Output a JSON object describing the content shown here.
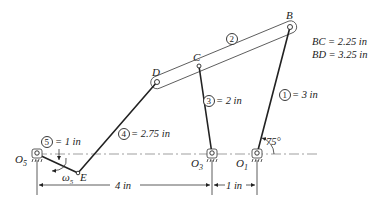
{
  "diagram": {
    "type": "six-bar linkage kinematic diagram",
    "joints": {
      "B": "B",
      "C": "C",
      "D": "D",
      "E": "E",
      "O1": "O",
      "O1_sub": "1",
      "O3": "O",
      "O3_sub": "3",
      "O5": "O",
      "O5_sub": "5"
    },
    "links": [
      {
        "id": "1",
        "label": "= 3 in"
      },
      {
        "id": "2",
        "label": ""
      },
      {
        "id": "3",
        "label": "= 2 in"
      },
      {
        "id": "4",
        "label": "= 2.75 in"
      },
      {
        "id": "5",
        "label": "= 1 in"
      }
    ],
    "notes": {
      "bc": "BC = 2.25 in",
      "bd": "BD = 3.25 in"
    },
    "angle": "75°",
    "omega": "ω",
    "omega_sub": "5",
    "dimensions": {
      "o5_o3": "4 in",
      "o3_o1": "1 in"
    }
  }
}
